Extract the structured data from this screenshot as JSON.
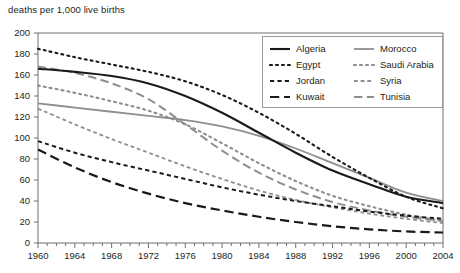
{
  "chart_data": {
    "type": "line",
    "title": "deaths per 1,000 live births",
    "xlabel": "",
    "ylabel": "deaths per 1,000 live births",
    "xlim": [
      1960,
      2004
    ],
    "ylim": [
      0,
      200
    ],
    "ytick_step": 20,
    "xtick_step": 4,
    "minor_xtick_step": 1,
    "grid": false,
    "legend_position": "top-right",
    "ytick_labels": [
      "200",
      "180",
      "160",
      "140",
      "120",
      "100",
      "80",
      "60",
      "40",
      "20",
      "0"
    ],
    "xtick_labels": [
      "1960",
      "1964",
      "1968",
      "1972",
      "1976",
      "1980",
      "1984",
      "1988",
      "1992",
      "1996",
      "2000",
      "2004"
    ],
    "x": [
      1960,
      1964,
      1968,
      1972,
      1976,
      1980,
      1984,
      1988,
      1992,
      1996,
      2000,
      2004
    ],
    "series": [
      {
        "name": "Algeria",
        "color": "#1a1a1a",
        "dash": "solid",
        "width": 2.1,
        "values": [
          166,
          163,
          159,
          152,
          140,
          124,
          105,
          86,
          69,
          56,
          44,
          38
        ]
      },
      {
        "name": "Egypt",
        "color": "#1a1a1a",
        "dash": "dotted",
        "width": 2.1,
        "values": [
          185,
          177,
          170,
          163,
          154,
          141,
          124,
          104,
          82,
          62,
          44,
          33
        ]
      },
      {
        "name": "Jordan",
        "color": "#1a1a1a",
        "dash": "short-dash",
        "width": 2.0,
        "values": [
          97,
          86,
          77,
          69,
          61,
          53,
          46,
          40,
          35,
          30,
          26,
          23
        ]
      },
      {
        "name": "Kuwait",
        "color": "#1a1a1a",
        "dash": "long-dash",
        "width": 2.2,
        "values": [
          89,
          72,
          58,
          47,
          38,
          31,
          25,
          20,
          16,
          13,
          11,
          10
        ]
      },
      {
        "name": "Morocco",
        "color": "#8e8e8e",
        "dash": "solid",
        "width": 1.8,
        "values": [
          133,
          129,
          125,
          121,
          117,
          111,
          102,
          90,
          76,
          62,
          48,
          40
        ]
      },
      {
        "name": "Saudi Arabia",
        "color": "#8e8e8e",
        "dash": "dotted",
        "width": 2.1,
        "values": [
          150,
          143,
          135,
          126,
          113,
          95,
          76,
          59,
          45,
          35,
          27,
          21
        ]
      },
      {
        "name": "Syria",
        "color": "#8e8e8e",
        "dash": "short-dash",
        "width": 1.8,
        "values": [
          128,
          113,
          99,
          86,
          73,
          61,
          50,
          41,
          34,
          28,
          23,
          19
        ]
      },
      {
        "name": "Tunisia",
        "color": "#8e8e8e",
        "dash": "long-dash",
        "width": 2.0,
        "values": [
          168,
          162,
          152,
          137,
          113,
          88,
          67,
          51,
          39,
          31,
          25,
          21
        ]
      }
    ]
  },
  "legend": {
    "entries": [
      {
        "label": "Algeria",
        "column": 0
      },
      {
        "label": "Morocco",
        "column": 1
      },
      {
        "label": "Egypt",
        "column": 0
      },
      {
        "label": "Saudi Arabia",
        "column": 1
      },
      {
        "label": "Jordan",
        "column": 0
      },
      {
        "label": "Syria",
        "column": 1
      },
      {
        "label": "Kuwait",
        "column": 0
      },
      {
        "label": "Tunisia",
        "column": 1
      }
    ]
  },
  "colors": {
    "black_series": "#1a1a1a",
    "gray_series": "#8e8e8e",
    "axis": "#6f6f6f",
    "text": "#231f20",
    "legend_border": "#9a9a9a",
    "background": "#ffffff"
  }
}
